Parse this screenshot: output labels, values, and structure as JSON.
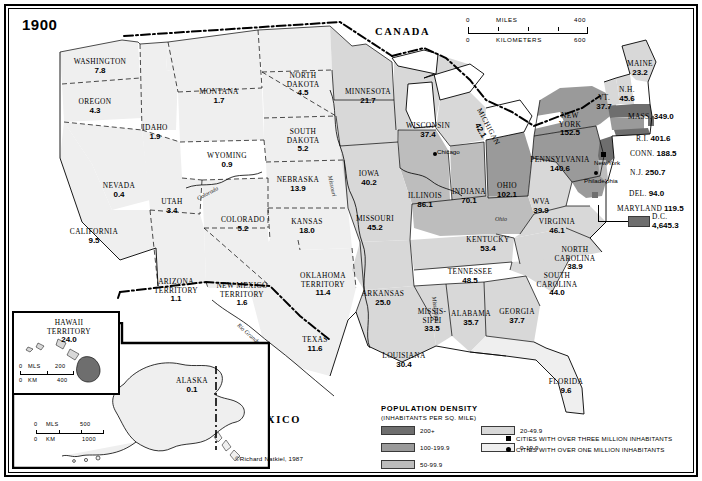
{
  "map": {
    "year": "1900",
    "credit": "©Richard Natkiel, 1987",
    "countries": [
      {
        "name": "CANADA"
      },
      {
        "name": "MEXICO"
      }
    ],
    "rivers": [
      "Missouri",
      "Mississippi",
      "Ohio",
      "Colorado",
      "Rio Grande"
    ]
  },
  "scale_top": {
    "miles_label": "MILES",
    "kilometers_label": "KILOMETERS",
    "miles_zero": "0",
    "miles_max": "400",
    "km_zero": "0",
    "km_max": "600"
  },
  "states": [
    {
      "name": "WASHINGTON",
      "value": "7.8",
      "band": "0-19.9"
    },
    {
      "name": "OREGON",
      "value": "4.3",
      "band": "0-19.9"
    },
    {
      "name": "IDAHO",
      "value": "1.9",
      "band": "0-19.9"
    },
    {
      "name": "MONTANA",
      "value": "1.7",
      "band": "0-19.9"
    },
    {
      "name": "WYOMING",
      "value": "0.9",
      "band": "0-19.9"
    },
    {
      "name": "NORTH DAKOTA",
      "value": "4.5",
      "band": "0-19.9"
    },
    {
      "name": "SOUTH DAKOTA",
      "value": "5.2",
      "band": "0-19.9"
    },
    {
      "name": "NEBRASKA",
      "value": "13.9",
      "band": "0-19.9"
    },
    {
      "name": "KANSAS",
      "value": "18.0",
      "band": "0-19.9"
    },
    {
      "name": "NEVADA",
      "value": "0.4",
      "band": "0-19.9"
    },
    {
      "name": "UTAH",
      "value": "3.4",
      "band": "0-19.9"
    },
    {
      "name": "COLORADO",
      "value": "5.2",
      "band": "0-19.9"
    },
    {
      "name": "CALIFORNIA",
      "value": "9.5",
      "band": "0-19.9"
    },
    {
      "name": "ARIZONA TERRITORY",
      "value": "1.1",
      "band": "0-19.9"
    },
    {
      "name": "NEW MEXICO TERRITORY",
      "value": "1.6",
      "band": "0-19.9"
    },
    {
      "name": "OKLAHOMA TERRITORY",
      "value": "11.4",
      "band": "0-19.9"
    },
    {
      "name": "TEXAS",
      "value": "11.6",
      "band": "0-19.9"
    },
    {
      "name": "MINNESOTA",
      "value": "21.7",
      "band": "20-49.9"
    },
    {
      "name": "WISCONSIN",
      "value": "37.4",
      "band": "20-49.9"
    },
    {
      "name": "IOWA",
      "value": "40.2",
      "band": "20-49.9"
    },
    {
      "name": "MISSOURI",
      "value": "45.2",
      "band": "20-49.9"
    },
    {
      "name": "ARKANSAS",
      "value": "25.0",
      "band": "20-49.9"
    },
    {
      "name": "LOUISIANA",
      "value": "30.4",
      "band": "20-49.9"
    },
    {
      "name": "MISSIS-SIPPI",
      "value": "33.5",
      "band": "20-49.9"
    },
    {
      "name": "ALABAMA",
      "value": "35.7",
      "band": "20-49.9"
    },
    {
      "name": "GEORGIA",
      "value": "37.7",
      "band": "20-49.9"
    },
    {
      "name": "FLORIDA",
      "value": "9.6",
      "band": "0-19.9"
    },
    {
      "name": "SOUTH CAROLINA",
      "value": "44.0",
      "band": "20-49.9"
    },
    {
      "name": "NORTH CAROLINA",
      "value": "38.9",
      "band": "20-49.9"
    },
    {
      "name": "TENNESSEE",
      "value": "48.5",
      "band": "20-49.9"
    },
    {
      "name": "KENTUCKY",
      "value": "53.4",
      "band": "50-99.9"
    },
    {
      "name": "VIRGINIA",
      "value": "46.1",
      "band": "20-49.9"
    },
    {
      "name": "WVA",
      "value": "39.9",
      "band": "20-49.9"
    },
    {
      "name": "ILLINOIS",
      "value": "86.1",
      "band": "50-99.9"
    },
    {
      "name": "INDIANA",
      "value": "70.1",
      "band": "50-99.9"
    },
    {
      "name": "OHIO",
      "value": "102.1",
      "band": "100-199.9"
    },
    {
      "name": "MICHIGAN",
      "value": "42.1",
      "band": "20-49.9"
    },
    {
      "name": "MAINE",
      "value": "23.2",
      "band": "20-49.9"
    },
    {
      "name": "N.H.",
      "value": "45.6",
      "band": "20-49.9"
    },
    {
      "name": "VT.",
      "value": "37.7",
      "band": "20-49.9"
    },
    {
      "name": "NEW YORK",
      "value": "152.5",
      "band": "100-199.9"
    },
    {
      "name": "PENNSYLVANIA",
      "value": "140.6",
      "band": "100-199.9"
    },
    {
      "name": "MASS.",
      "value": "349.0",
      "band": "200+"
    },
    {
      "name": "R.I.",
      "value": "401.6",
      "band": "200+"
    },
    {
      "name": "CONN.",
      "value": "188.5",
      "band": "100-199.9"
    },
    {
      "name": "N.J.",
      "value": "250.7",
      "band": "200+"
    },
    {
      "name": "DEL.",
      "value": "94.0",
      "band": "50-99.9"
    },
    {
      "name": "MARYLAND",
      "value": "119.5",
      "band": "100-199.9"
    },
    {
      "name": "D.C.",
      "value": "4,645.3",
      "band": "200+"
    },
    {
      "name": "ALASKA",
      "value": "0.1",
      "band": "0-19.9"
    },
    {
      "name": "HAWAII TERRITORY",
      "value": "24.0",
      "band": "20-49.9"
    }
  ],
  "cities": [
    {
      "name": "New York",
      "type": "over-three-million"
    },
    {
      "name": "Chicago",
      "type": "over-one-million"
    },
    {
      "name": "Philadelphia",
      "type": "over-one-million"
    }
  ],
  "legend": {
    "title": "POPULATION DENSITY",
    "subtitle": "(INHABITANTS PER SQ. MILE)",
    "bands": [
      {
        "label": "200+",
        "color": "#6e6e6e"
      },
      {
        "label": "100-199.9",
        "color": "#9a9a9a"
      },
      {
        "label": "50-99.9",
        "color": "#bdbdbd"
      },
      {
        "label": "20-49.9",
        "color": "#d8d8d8"
      },
      {
        "label": "0-19.9",
        "color": "#efefef"
      }
    ],
    "city_keys": [
      {
        "label": "CITIES WITH OVER THREE MILLION INHABITANTS",
        "marker": "square"
      },
      {
        "label": "CITIES WITH OVER ONE MILLION INHABITANTS",
        "marker": "circle"
      }
    ]
  },
  "insets": {
    "hawaii": {
      "name": "HAWAII TERRITORY",
      "value": "24.0",
      "scale": {
        "mls_label": "MLS",
        "mls_zero": "0",
        "mls_max": "200",
        "km_label": "KM",
        "km_zero": "0",
        "km_max": "400"
      }
    },
    "alaska": {
      "name": "ALASKA",
      "value": "0.1",
      "scale": {
        "mls_label": "MLS",
        "mls_zero": "0",
        "mls_max": "500",
        "km_label": "KM",
        "km_zero": "0",
        "km_max": "1000"
      }
    }
  }
}
